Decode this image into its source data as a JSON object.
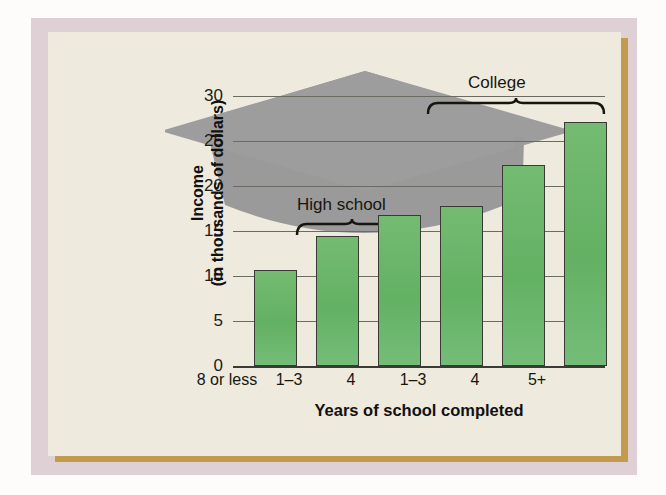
{
  "chart_data": {
    "type": "bar",
    "title": "",
    "xlabel": "Years of school completed",
    "ylabel": "Income\n(in thousands of dollars)",
    "ylabel_line1": "Income",
    "ylabel_line2": "(in thousands of dollars)",
    "categories": [
      "8 or less",
      "1–3",
      "4",
      "1–3",
      "4",
      "5+"
    ],
    "values": [
      10.7,
      14.5,
      16.8,
      17.8,
      22.3,
      27.1
    ],
    "ylim": [
      0,
      32
    ],
    "yticks": [
      0,
      5,
      10,
      15,
      20,
      25,
      30
    ],
    "ytick_labels": [
      "0",
      "5",
      "10",
      "15",
      "20",
      "25",
      "30"
    ],
    "grid": true,
    "legend": "none",
    "annotations": [
      {
        "name": "high-school-bracket",
        "label": "High school",
        "spans": [
          1,
          2
        ]
      },
      {
        "name": "college-bracket",
        "label": "College",
        "spans": [
          3,
          5
        ]
      }
    ],
    "decoration": "graduation-cap-silhouette",
    "bar_color": "#68b468",
    "bar_border_color": "#3a3a34",
    "panel_color": "#eeeade",
    "frame_color": "#ded0d4",
    "shadow_color": "#c39b4e",
    "cap_color": "#9a9a9a"
  },
  "brackets": {
    "high_school": "High school",
    "college": "College"
  }
}
